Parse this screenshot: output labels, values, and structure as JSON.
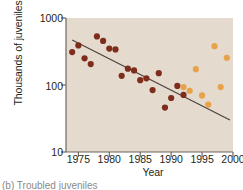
{
  "chart_data": {
    "type": "scatter",
    "title": "",
    "xlabel": "Year",
    "ylabel": "Thousands of juveniles",
    "xlim": [
      1973,
      2000
    ],
    "ylim": [
      10,
      1000
    ],
    "yscale": "log",
    "grid": false,
    "legend_position": "none",
    "xticks": [
      1975,
      1980,
      1985,
      1990,
      1995,
      2000
    ],
    "yticks": [
      10,
      100,
      1000
    ],
    "series": [
      {
        "name": "wild juveniles",
        "color": "#7e2d1c",
        "points": [
          {
            "x": 1974,
            "y": 310
          },
          {
            "x": 1975,
            "y": 390
          },
          {
            "x": 1976,
            "y": 250
          },
          {
            "x": 1977,
            "y": 205
          },
          {
            "x": 1978,
            "y": 530
          },
          {
            "x": 1979,
            "y": 455
          },
          {
            "x": 1980,
            "y": 350
          },
          {
            "x": 1981,
            "y": 340
          },
          {
            "x": 1982,
            "y": 137
          },
          {
            "x": 1983,
            "y": 175
          },
          {
            "x": 1984,
            "y": 165
          },
          {
            "x": 1985,
            "y": 118
          },
          {
            "x": 1986,
            "y": 126
          },
          {
            "x": 1987,
            "y": 84
          },
          {
            "x": 1988,
            "y": 150
          },
          {
            "x": 1989,
            "y": 46
          },
          {
            "x": 1990,
            "y": 64
          },
          {
            "x": 1991,
            "y": 97
          },
          {
            "x": 1992,
            "y": 71
          }
        ]
      },
      {
        "name": "hatchery juveniles",
        "color": "#e8a24a",
        "points": [
          {
            "x": 1992,
            "y": 93
          },
          {
            "x": 1993,
            "y": 82
          },
          {
            "x": 1994,
            "y": 172
          },
          {
            "x": 1995,
            "y": 70
          },
          {
            "x": 1996,
            "y": 51
          },
          {
            "x": 1997,
            "y": 380
          },
          {
            "x": 1998,
            "y": 93
          },
          {
            "x": 1999,
            "y": 255
          }
        ]
      }
    ],
    "trendline": {
      "name": "declining trend",
      "color": "#4a4038",
      "x_start": 1974,
      "y_start": 470,
      "x_end": 1999.5,
      "y_end": 30
    }
  },
  "axis": {
    "y_tick_labels": [
      "1000",
      "100",
      "10"
    ],
    "x_tick_labels": [
      "1975",
      "1980",
      "1985",
      "1990",
      "1995",
      "2000"
    ],
    "y_axis_title": "Thousands of juveniles",
    "x_axis_title": "Year"
  },
  "caption": {
    "text": "(b) Troubled juveniles"
  },
  "colors": {
    "plot_background": "#e4dace",
    "axis_line": "#6d6761",
    "dark_marker": "#7e2d1c",
    "light_marker": "#e8a24a",
    "trend_line": "#4a4038",
    "text": "#231f20"
  }
}
